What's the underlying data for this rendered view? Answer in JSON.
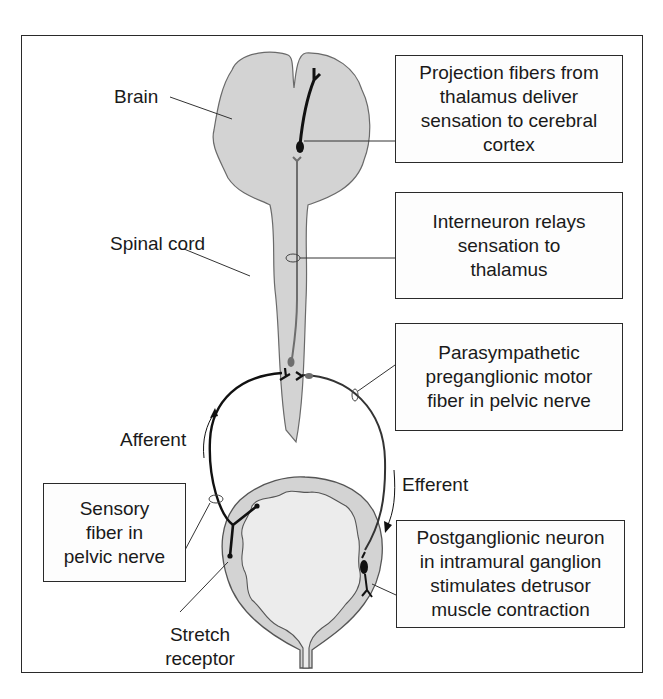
{
  "diagram": {
    "title_hidden": "Micturition reflex pathway",
    "labels": {
      "brain": "Brain",
      "spinal_cord": "Spinal cord",
      "afferent": "Afferent",
      "efferent": "Efferent",
      "stretch_receptor_line1": "Stretch",
      "stretch_receptor_line2": "receptor"
    },
    "boxes": {
      "projection": [
        "Projection fibers from",
        "thalamus deliver",
        "sensation to cerebral",
        "cortex"
      ],
      "interneuron": [
        "Interneuron relays",
        "sensation to",
        "thalamus"
      ],
      "parasympathetic": [
        "Parasympathetic",
        "preganglionic motor",
        "fiber in pelvic nerve"
      ],
      "sensory": [
        "Sensory",
        "fiber in",
        "pelvic nerve"
      ],
      "postganglionic": [
        "Postganglionic neuron",
        "in intramural ganglion",
        "stimulates detrusor",
        "muscle contraction"
      ]
    },
    "colors": {
      "tissue_fill": "#d3d3d3",
      "bladder_lumen": "#ececec",
      "outline": "#555555",
      "neuron": "#111111",
      "interneuron": "#6e6e6e",
      "frame": "#2a2a2a"
    }
  }
}
